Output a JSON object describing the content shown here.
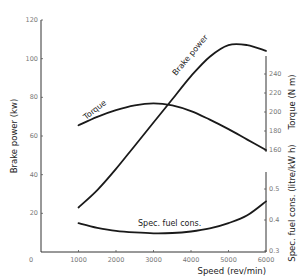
{
  "chart_data": {
    "type": "line",
    "title": "",
    "xlabel": "Speed (rev/min)",
    "x_ticks": [
      0,
      1000,
      2000,
      3000,
      4000,
      5000,
      6000
    ],
    "xlim": [
      0,
      6000
    ],
    "grid": false,
    "legend": "none (curves labelled inline)",
    "axes": {
      "left": {
        "label": "Brake power (kw)",
        "ticks": [
          0,
          20,
          40,
          60,
          80,
          100,
          120
        ],
        "range": [
          0,
          120
        ]
      },
      "right_upper": {
        "label": "Torque (N m)",
        "ticks": [
          160,
          180,
          200,
          220,
          240
        ],
        "range": [
          160,
          240
        ]
      },
      "right_lower": {
        "label": "Spec. fuel cons. (litre/kW h)",
        "ticks": [
          0.3,
          0.4,
          0.5
        ],
        "range": [
          0.3,
          0.5
        ]
      }
    },
    "series": [
      {
        "name": "Torque",
        "axis": "right_upper",
        "unit": "N m",
        "x": [
          1000,
          1500,
          2000,
          2500,
          3000,
          3500,
          4000,
          4500,
          5000,
          5500,
          6000
        ],
        "values": [
          186,
          195,
          202,
          207,
          209,
          207,
          201,
          192,
          182,
          171,
          160
        ]
      },
      {
        "name": "Brake power",
        "axis": "left",
        "unit": "kW",
        "x": [
          1000,
          1500,
          2000,
          2500,
          3000,
          3500,
          4000,
          4500,
          5000,
          5500,
          6000
        ],
        "values": [
          23,
          32,
          43,
          55,
          67,
          79,
          91,
          101,
          107,
          107,
          104
        ]
      },
      {
        "name": "Spec. fuel cons.",
        "axis": "right_lower",
        "unit": "litre/kW h",
        "x": [
          1000,
          1500,
          2000,
          2500,
          3000,
          3500,
          4000,
          4500,
          5000,
          5500,
          6000
        ],
        "values": [
          0.39,
          0.375,
          0.365,
          0.36,
          0.357,
          0.358,
          0.363,
          0.373,
          0.39,
          0.415,
          0.46
        ]
      }
    ],
    "annotations": [
      "Torque",
      "Brake power",
      "Spec. fuel cons."
    ]
  },
  "labels": {
    "left_axis": "Brake power (kw)",
    "right_upper_axis": "Torque (N m)",
    "right_lower_axis": "Spec. fuel cons. (litre/kW h)",
    "x_axis": "Speed (rev/min)",
    "torque_curve": "Torque",
    "power_curve": "Brake power",
    "fuel_curve": "Spec. fuel cons.",
    "origin": "0"
  }
}
